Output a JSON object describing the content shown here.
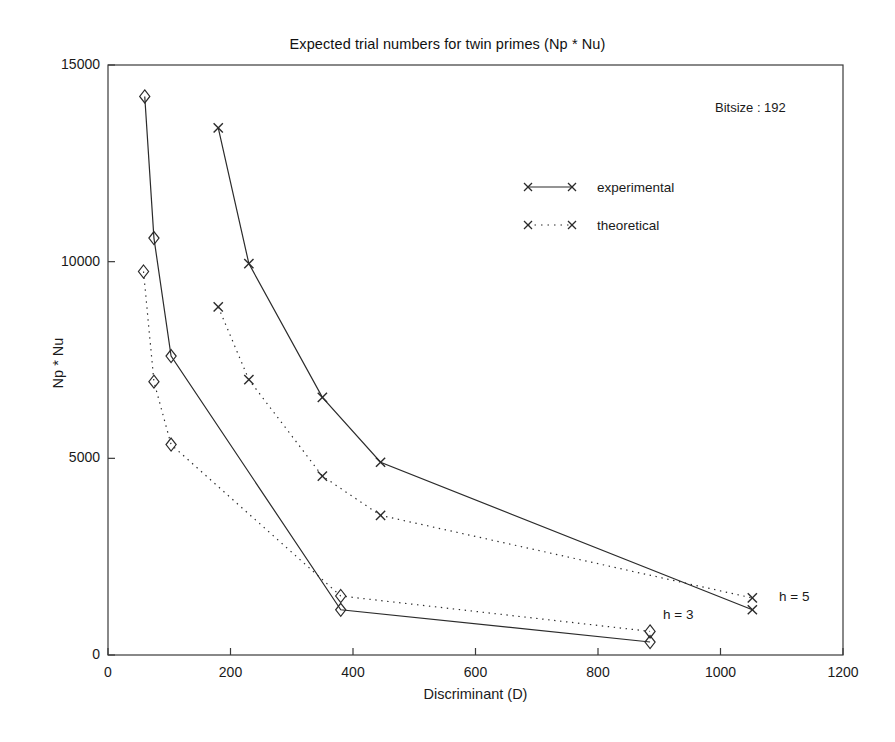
{
  "chart_data": {
    "type": "line",
    "title": "Expected trial numbers for twin primes (Np * Nu)",
    "xlabel": "Discriminant (D)",
    "ylabel": "Np * Nu",
    "xlim": [
      0,
      1200
    ],
    "ylim": [
      0,
      15000
    ],
    "xticks": [
      0,
      200,
      400,
      600,
      800,
      1000,
      1200
    ],
    "yticks": [
      0,
      5000,
      10000,
      15000
    ],
    "grid": false,
    "legend_position": "upper-center-right",
    "annotations": [
      {
        "text": "Bitsize : 192",
        "x": 1020,
        "y": 14150
      },
      {
        "text": "h = 3",
        "x": 910,
        "y": 1250
      },
      {
        "text": "h = 5",
        "x": 1098,
        "y": 1700
      }
    ],
    "legend": [
      {
        "name": "experimental",
        "style": "solid",
        "marker": "x"
      },
      {
        "name": "theoretical",
        "style": "dotted",
        "marker": "x"
      }
    ],
    "series": [
      {
        "name": "experimental h = 3",
        "group": "h = 3",
        "kind": "experimental",
        "style": "solid",
        "marker": "diamond",
        "x": [
          60,
          75,
          103,
          380,
          885
        ],
        "y": [
          14200,
          10600,
          7600,
          1150,
          330
        ]
      },
      {
        "name": "theoretical h = 3",
        "group": "h = 3",
        "kind": "theoretical",
        "style": "dotted",
        "marker": "diamond",
        "x": [
          58,
          75,
          103,
          380,
          885
        ],
        "y": [
          9750,
          6950,
          5350,
          1500,
          600
        ]
      },
      {
        "name": "experimental h = 5",
        "group": "h = 5",
        "kind": "experimental",
        "style": "solid",
        "marker": "x",
        "x": [
          180,
          230,
          350,
          445,
          1052
        ],
        "y": [
          13400,
          9950,
          6550,
          4900,
          1150
        ]
      },
      {
        "name": "theoretical h = 5",
        "group": "h = 5",
        "kind": "theoretical",
        "style": "dotted",
        "marker": "x",
        "x": [
          180,
          230,
          350,
          445,
          1052
        ],
        "y": [
          8850,
          7000,
          4550,
          3550,
          1450
        ]
      }
    ]
  },
  "axis": {
    "y_tick_labels": [
      "0",
      "5000",
      "10000",
      "15000"
    ],
    "x_tick_labels": [
      "0",
      "200",
      "400",
      "600",
      "800",
      "1000",
      "1200"
    ]
  }
}
